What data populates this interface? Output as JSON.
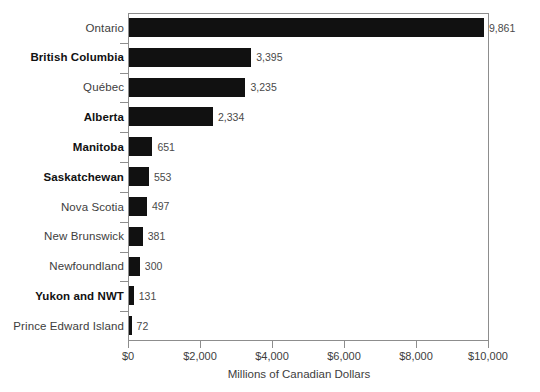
{
  "chart_data": {
    "type": "bar",
    "orientation": "horizontal",
    "title": "",
    "xlabel": "Millions of Canadian Dollars",
    "ylabel": "",
    "xlim": [
      0,
      10000
    ],
    "xticks": [
      0,
      2000,
      4000,
      6000,
      8000,
      10000
    ],
    "xtick_labels": [
      "$0",
      "$2,000",
      "$4,000",
      "$6,000",
      "$8,000",
      "$10,000"
    ],
    "grid": false,
    "legend": null,
    "bar_color": "#111111",
    "frame_color": "#8d8d8d",
    "categories": [
      "Ontario",
      "British Columbia",
      "Québec",
      "Alberta",
      "Manitoba",
      "Saskatchewan",
      "Nova Scotia",
      "New Brunswick",
      "Newfoundland",
      "Yukon and NWT",
      "Prince Edward Island"
    ],
    "values": [
      9861,
      3395,
      3235,
      2334,
      651,
      553,
      497,
      381,
      300,
      131,
      72
    ],
    "value_labels": [
      "9,861",
      "3,395",
      "3,235",
      "2,334",
      "651",
      "553",
      "497",
      "381",
      "300",
      "131",
      "72"
    ],
    "label_emphasis": [
      false,
      true,
      false,
      true,
      true,
      true,
      false,
      false,
      false,
      true,
      false
    ]
  }
}
